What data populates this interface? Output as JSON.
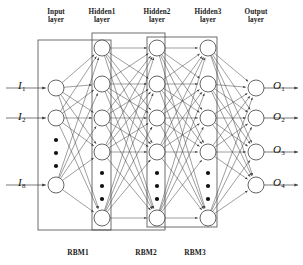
{
  "figure": {
    "type": "neural-network-diagram"
  },
  "layer_labels": [
    {
      "id": "input",
      "line1": "Input",
      "line2": "layer",
      "x": 56,
      "y": 8
    },
    {
      "id": "hidden1",
      "line1": "Hidden1",
      "line2": "layer",
      "x": 102,
      "y": 8
    },
    {
      "id": "hidden2",
      "line1": "Hidden2",
      "line2": "layer",
      "x": 157,
      "y": 8
    },
    {
      "id": "hidden3",
      "line1": "Hidden3",
      "line2": "layer",
      "x": 208,
      "y": 8
    },
    {
      "id": "output",
      "line1": "Output",
      "line2": "layer",
      "x": 256,
      "y": 8
    }
  ],
  "rbm_labels": [
    {
      "id": "rbm1",
      "text": "RBM1",
      "x": 78,
      "y": 248
    },
    {
      "id": "rbm2",
      "text": "RBM2",
      "x": 146,
      "y": 248
    },
    {
      "id": "rbm3",
      "text": "RBM3",
      "x": 195,
      "y": 248
    }
  ],
  "input_labels": [
    {
      "symbol": "I",
      "sub": "1",
      "x": 26,
      "y": 79
    },
    {
      "symbol": "I",
      "sub": "2",
      "x": 26,
      "y": 110
    },
    {
      "symbol": "I",
      "sub": "8",
      "x": 26,
      "y": 176
    }
  ],
  "output_labels": [
    {
      "symbol": "O",
      "sub": "1",
      "x": 281,
      "y": 79
    },
    {
      "symbol": "O",
      "sub": "2",
      "x": 281,
      "y": 110
    },
    {
      "symbol": "O",
      "sub": "3",
      "x": 281,
      "y": 143
    },
    {
      "symbol": "O",
      "sub": "4",
      "x": 281,
      "y": 176
    }
  ],
  "layers": [
    {
      "id": "input",
      "x": 56,
      "radius": 8,
      "nodes_y": [
        88,
        118,
        185
      ],
      "ellipsis_y": [
        140,
        153,
        166
      ]
    },
    {
      "id": "hidden1",
      "x": 102,
      "radius": 8,
      "nodes_y": [
        48,
        84,
        118,
        152,
        218
      ],
      "ellipsis_y": [
        173,
        186,
        199
      ]
    },
    {
      "id": "hidden2",
      "x": 157,
      "radius": 8,
      "nodes_y": [
        48,
        84,
        118,
        152,
        218
      ],
      "ellipsis_y": [
        173,
        186,
        199
      ]
    },
    {
      "id": "hidden3",
      "x": 208,
      "radius": 8,
      "nodes_y": [
        48,
        84,
        118,
        152,
        218
      ],
      "ellipsis_y": [
        173,
        186,
        199
      ]
    },
    {
      "id": "output",
      "x": 256,
      "radius": 8,
      "nodes_y": [
        88,
        118,
        152,
        185
      ],
      "ellipsis_y": []
    }
  ],
  "rbm_boxes": [
    {
      "id": "rbm1",
      "x": 38,
      "y": 40,
      "width": 73,
      "height": 190
    },
    {
      "id": "rbm2",
      "x": 92,
      "y": 33,
      "width": 73,
      "height": 197
    },
    {
      "id": "rbm3",
      "x": 147,
      "y": 37,
      "width": 70,
      "height": 190
    }
  ],
  "io_arrows": {
    "input_x_start": 6,
    "output_x_end": 298
  },
  "colors": {
    "stroke": "#3f3f3f",
    "node_fill": "#ffffff",
    "box_stroke": "#4a4a4a",
    "text": "#1a1a1a",
    "background": "#ffffff"
  },
  "chart_data": {
    "type": "diagram",
    "title": "",
    "node_counts": {
      "input": 8,
      "hidden1": "n",
      "hidden2": "n",
      "hidden3": "n",
      "output": 4
    }
  }
}
